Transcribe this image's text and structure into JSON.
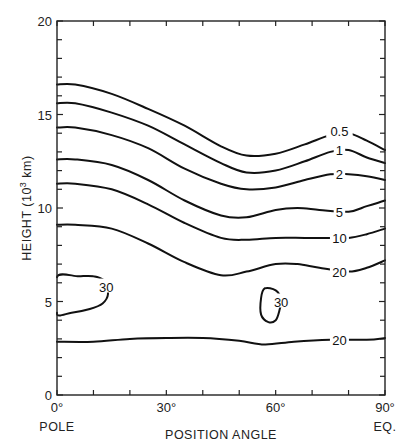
{
  "chart_data": {
    "type": "contour",
    "title": "",
    "xlabel": "POSITION ANGLE",
    "ylabel": "HEIGHT (10³ km)",
    "xlim": [
      0,
      90
    ],
    "ylim": [
      0,
      20
    ],
    "x_ticks": [
      {
        "value": 0,
        "label": "0°",
        "sublabel": "POLE"
      },
      {
        "value": 30,
        "label": "30°"
      },
      {
        "value": 60,
        "label": "60°"
      },
      {
        "value": 90,
        "label": "90°",
        "sublabel": "EQ."
      }
    ],
    "x_minor_tick_step": 10,
    "y_ticks": [
      {
        "value": 0,
        "label": "0"
      },
      {
        "value": 5,
        "label": "5"
      },
      {
        "value": 10,
        "label": "10"
      },
      {
        "value": 15,
        "label": "15"
      },
      {
        "value": 20,
        "label": "20"
      }
    ],
    "y_minor_tick_step": 1,
    "grid": false,
    "series": [
      {
        "name": "0.5",
        "label_pos": [
          77.5,
          14.1
        ],
        "x": [
          0,
          5,
          15,
          25,
          35,
          45,
          52,
          60,
          68,
          75,
          80,
          85,
          90
        ],
        "y": [
          16.6,
          16.6,
          16.1,
          15.3,
          14.4,
          13.3,
          12.8,
          12.9,
          13.4,
          13.9,
          14.0,
          13.6,
          13.1
        ]
      },
      {
        "name": "1",
        "label_pos": [
          77.5,
          13.1
        ],
        "x": [
          0,
          5,
          15,
          25,
          35,
          45,
          52,
          60,
          68,
          75,
          80,
          85,
          90
        ],
        "y": [
          15.6,
          15.6,
          15.1,
          14.4,
          13.4,
          12.4,
          11.9,
          12.0,
          12.5,
          13.0,
          13.1,
          12.7,
          12.4
        ]
      },
      {
        "name": "2",
        "label_pos": [
          77.5,
          11.8
        ],
        "x": [
          0,
          5,
          15,
          25,
          35,
          45,
          52,
          60,
          68,
          75,
          80,
          85,
          90
        ],
        "y": [
          14.3,
          14.3,
          13.9,
          13.2,
          12.1,
          11.3,
          11.0,
          11.1,
          11.5,
          11.8,
          11.8,
          11.7,
          11.5
        ]
      },
      {
        "name": "5",
        "label_pos": [
          77.5,
          9.8
        ],
        "x": [
          0,
          5,
          15,
          25,
          35,
          45,
          52,
          60,
          66,
          72,
          80,
          85,
          90
        ],
        "y": [
          12.6,
          12.6,
          12.3,
          11.5,
          10.4,
          9.6,
          9.5,
          9.9,
          10.0,
          9.9,
          9.8,
          10.1,
          10.4
        ]
      },
      {
        "name": "10",
        "label_pos": [
          77.5,
          8.4
        ],
        "x": [
          0,
          5,
          15,
          25,
          35,
          45,
          52,
          60,
          68,
          75,
          80,
          85,
          90
        ],
        "y": [
          11.3,
          11.3,
          11.0,
          10.2,
          9.2,
          8.4,
          8.3,
          8.4,
          8.4,
          8.4,
          8.4,
          8.6,
          8.9
        ]
      },
      {
        "name": "20",
        "label_pos": [
          77.5,
          6.6
        ],
        "x": [
          0,
          5,
          15,
          25,
          35,
          45,
          52,
          60,
          66,
          72,
          80,
          85,
          90
        ],
        "y": [
          9.1,
          9.1,
          8.9,
          8.1,
          7.1,
          6.4,
          6.6,
          7.0,
          7.0,
          6.8,
          6.6,
          6.8,
          7.2
        ]
      },
      {
        "name": "30",
        "closed": true,
        "label_pos": [
          13.5,
          5.8
        ],
        "note": "closed contour near pole",
        "x": [
          0,
          6,
          10,
          13,
          14,
          12.5,
          9,
          4,
          0
        ],
        "y": [
          6.3,
          6.35,
          6.35,
          6.1,
          5.4,
          4.9,
          4.6,
          4.4,
          4.4
        ]
      },
      {
        "name": "30",
        "closed": true,
        "label_pos": [
          61.5,
          5.0
        ],
        "note": "closed contour near 57°",
        "x": [
          57,
          60,
          61.5,
          61,
          60,
          58,
          56,
          56,
          57
        ],
        "y": [
          5.7,
          5.6,
          5.1,
          4.5,
          4.0,
          3.9,
          4.3,
          5.2,
          5.7
        ]
      },
      {
        "name": "20",
        "label_pos": [
          77.5,
          2.95
        ],
        "note": "lower 20 contour",
        "x": [
          0,
          10,
          20,
          30,
          40,
          50,
          57,
          65,
          75,
          85,
          90
        ],
        "y": [
          2.85,
          2.85,
          3.0,
          3.05,
          3.05,
          2.9,
          2.7,
          2.85,
          2.95,
          2.95,
          3.05
        ]
      }
    ]
  },
  "axes": {
    "x_title": "POSITION ANGLE",
    "y_title_main": "HEIGHT (10",
    "y_title_sup": "3",
    "y_title_end": " km)",
    "x_pole_label": "POLE",
    "x_eq_label": "EQ."
  }
}
